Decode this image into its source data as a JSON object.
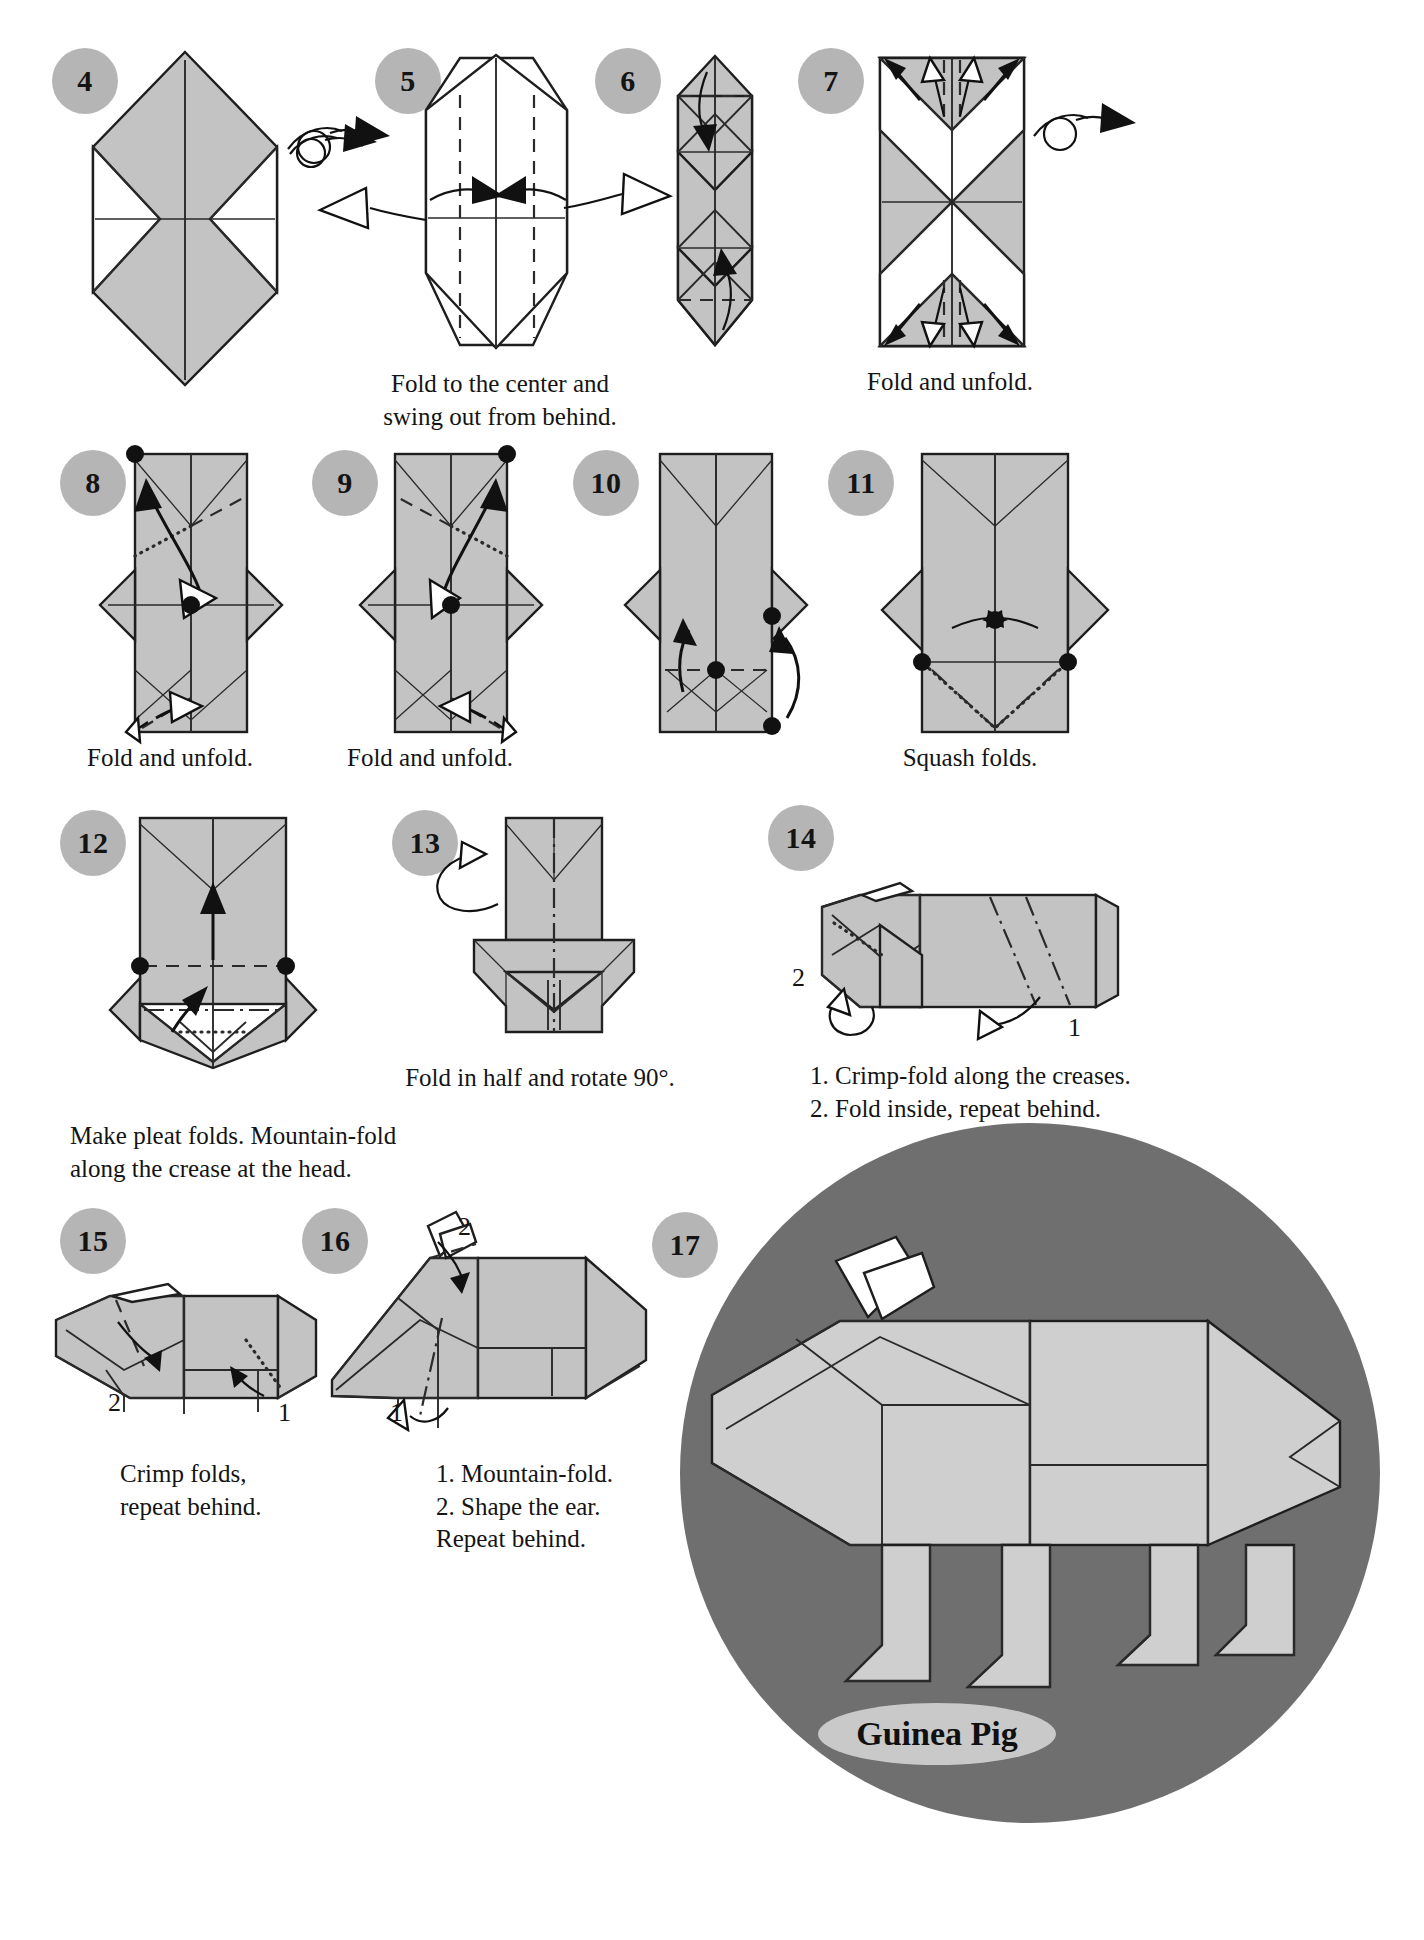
{
  "document": {
    "title": "Guinea Pig",
    "type": "origami-instruction-diagram",
    "model_name": "Guinea Pig"
  },
  "theme": {
    "paper_fill": "#c3c3c3",
    "paper_stroke": "#1e1e1e",
    "badge_fill": "#b5b5b5",
    "final_circle_fill": "#6f6f6f",
    "label_ellipse_fill": "#c9c9c9",
    "background": "#ffffff"
  },
  "steps": [
    {
      "number": "4",
      "caption": ""
    },
    {
      "number": "5",
      "caption": "Fold to the center and\nswing out from behind."
    },
    {
      "number": "6",
      "caption": ""
    },
    {
      "number": "7",
      "caption": "Fold and unfold."
    },
    {
      "number": "8",
      "caption": "Fold and unfold."
    },
    {
      "number": "9",
      "caption": "Fold and unfold."
    },
    {
      "number": "10",
      "caption": ""
    },
    {
      "number": "11",
      "caption": "Squash folds."
    },
    {
      "number": "12",
      "caption": "Make pleat folds. Mountain-fold\nalong the crease at the head."
    },
    {
      "number": "13",
      "caption": "Fold in half and rotate 90°."
    },
    {
      "number": "14",
      "caption": "1. Crimp-fold along the creases.\n2. Fold inside, repeat behind."
    },
    {
      "number": "15",
      "caption": "Crimp folds,\nrepeat behind."
    },
    {
      "number": "16",
      "caption": "1. Mountain-fold.\n2. Shape the ear.\nRepeat behind."
    },
    {
      "number": "17",
      "caption": ""
    }
  ],
  "inline_labels": {
    "step14_left": "2",
    "step14_right": "1",
    "step15_left": "2",
    "step15_right": "1",
    "step16_top": "2",
    "step16_left": "1"
  }
}
